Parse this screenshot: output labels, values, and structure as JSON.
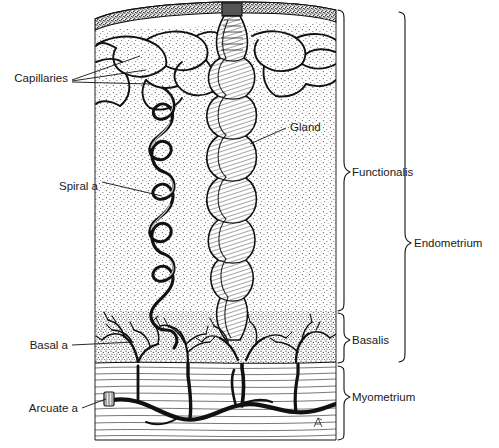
{
  "figure": {
    "background": "#ffffff",
    "ink_color": "#111111",
    "stipple_color": "#3a3a3a",
    "width": 499,
    "height": 448
  },
  "labels_left": [
    {
      "id": "capillaries",
      "text": "Capillaries",
      "x": 68,
      "y": 78
    },
    {
      "id": "spiral-artery",
      "text": "Spiral a",
      "x": 98,
      "y": 186
    },
    {
      "id": "basal-artery",
      "text": "Basal a",
      "x": 68,
      "y": 348
    },
    {
      "id": "arcuate-artery",
      "text": "Arcuate a",
      "x": 78,
      "y": 411
    }
  ],
  "labels_inner": [
    {
      "id": "gland",
      "text": "Gland",
      "x": 290,
      "y": 131
    }
  ],
  "brackets": [
    {
      "id": "functionalis",
      "text": "Functionalis",
      "x": 350,
      "y": 172,
      "top": 10,
      "bottom": 311,
      "spine": 343
    },
    {
      "id": "basalis",
      "text": "Basalis",
      "x": 350,
      "y": 340,
      "top": 313,
      "bottom": 363,
      "spine": 343
    },
    {
      "id": "myometrium",
      "text": "Myometrium",
      "x": 350,
      "y": 397,
      "top": 366,
      "bottom": 440,
      "spine": 343
    },
    {
      "id": "endometrium",
      "text": "Endometrium",
      "x": 412,
      "y": 243,
      "top": 12,
      "bottom": 362,
      "spine": 404
    }
  ],
  "regions": [
    {
      "id": "epithelium",
      "label": "surface epithelium",
      "top": 8,
      "bottom": 30
    },
    {
      "id": "functionalis-zone",
      "label": "functionalis stroma",
      "top": 30,
      "bottom": 311
    },
    {
      "id": "basalis-zone",
      "label": "basalis stroma",
      "top": 311,
      "bottom": 363
    },
    {
      "id": "myometrium-zone",
      "label": "myometrium muscle",
      "top": 363,
      "bottom": 440
    }
  ],
  "structures": {
    "gland_label": "Gland",
    "gland_x": 232,
    "gland_top": 14,
    "gland_bottom": 340,
    "spiral_x": 163,
    "spiral_top": 90,
    "spiral_bottom": 352,
    "arcuate_y": 404,
    "block_left": 95,
    "block_right": 336
  },
  "signature": {
    "id": "artist-monogram",
    "text": "",
    "x": 318,
    "y": 424
  }
}
